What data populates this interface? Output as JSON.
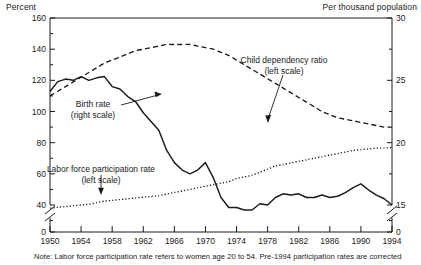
{
  "header": {
    "left_axis_title": "Percent",
    "right_axis_title": "Per thousand population"
  },
  "note": "Note: Labor force participation rate refers to women age 20 to 54.  Pre-1994  participation rates are corrected",
  "annotations": [
    {
      "name": "child-dependency-ratio",
      "line1": "Child dependency ratio",
      "line2": "(left scale)"
    },
    {
      "name": "birth-rate",
      "line1": "Birth rate",
      "line2": "(right scale)"
    },
    {
      "name": "labor-force-participation-rate",
      "line1": "Labor force participation rate",
      "line2": "(left scale)"
    }
  ],
  "axis": {
    "left_ticks": [
      "160",
      "140",
      "120",
      "100",
      "80",
      "60",
      "40",
      "0"
    ],
    "right_ticks": [
      "30",
      "25",
      "20",
      "15",
      "0"
    ],
    "x_ticks": [
      "1950",
      "1954",
      "1958",
      "1962",
      "1966",
      "1970",
      "1974",
      "1978",
      "1982",
      "1986",
      "1990",
      "1994"
    ]
  },
  "chart_data": {
    "type": "line",
    "title": "",
    "xlabel": "",
    "ylabel": "Percent",
    "y2label": "Per thousand population",
    "grid": false,
    "legend": "inline-annotations",
    "xlim": [
      1950,
      1994
    ],
    "ylim": [
      40,
      160
    ],
    "y2lim": [
      15,
      30
    ],
    "y_axis_break": true,
    "y2_axis_break": true,
    "x": [
      1950,
      1951,
      1952,
      1953,
      1954,
      1955,
      1956,
      1957,
      1958,
      1959,
      1960,
      1961,
      1962,
      1963,
      1964,
      1965,
      1966,
      1967,
      1968,
      1969,
      1970,
      1971,
      1972,
      1973,
      1974,
      1975,
      1976,
      1977,
      1978,
      1979,
      1980,
      1981,
      1982,
      1983,
      1984,
      1985,
      1986,
      1987,
      1988,
      1989,
      1990,
      1991,
      1992,
      1993,
      1994
    ],
    "series": [
      {
        "name": "Child dependency ratio (left scale)",
        "axis": "left",
        "style": "dashed",
        "units": "percent",
        "values": [
          110,
          113,
          116,
          119,
          122,
          125,
          128,
          131,
          133,
          135,
          137,
          139,
          140,
          141,
          142,
          143,
          143,
          143,
          143,
          142,
          141,
          140,
          138,
          136,
          133,
          130,
          127,
          124,
          121,
          118,
          115,
          112,
          109,
          106,
          103,
          100,
          98,
          96,
          95,
          94,
          93,
          92,
          91,
          90,
          90
        ]
      },
      {
        "name": "Birth rate (right scale)",
        "axis": "right",
        "style": "solid",
        "units": "per thousand population",
        "values": [
          24.1,
          24.9,
          25.1,
          25.0,
          25.3,
          25.0,
          25.2,
          25.3,
          24.5,
          24.3,
          23.7,
          23.3,
          22.4,
          21.7,
          21.0,
          19.4,
          18.4,
          17.8,
          17.5,
          17.8,
          18.4,
          17.2,
          15.6,
          14.8,
          14.8,
          14.6,
          14.6,
          15.1,
          15.0,
          15.6,
          15.9,
          15.8,
          15.9,
          15.6,
          15.6,
          15.8,
          15.6,
          15.7,
          16.0,
          16.4,
          16.7,
          16.2,
          15.8,
          15.5,
          15.0
        ]
      },
      {
        "name": "Labor force participation rate (left scale)",
        "axis": "left",
        "style": "dotted",
        "units": "percent",
        "values": [
          38,
          38.5,
          39,
          39.5,
          40,
          40.5,
          41.5,
          42.5,
          43,
          43.5,
          44,
          44.5,
          45,
          45.5,
          46,
          47,
          48,
          49,
          50,
          51,
          52,
          53,
          54,
          55,
          57,
          58,
          59,
          61,
          63,
          65,
          66,
          67,
          68,
          69,
          70,
          71,
          72,
          73,
          74,
          75,
          75.5,
          76,
          76.5,
          76.5,
          77
        ]
      }
    ]
  }
}
